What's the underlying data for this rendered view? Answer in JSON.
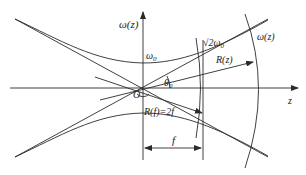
{
  "diagram": {
    "axes": {
      "vertical_label": "ω(z)",
      "horizontal_label": "z"
    },
    "labels": {
      "waist": "ω",
      "waist_sub": "0",
      "origin": "O",
      "angle": "θ",
      "angle_sub": "0",
      "sqrt2_waist": "√2ω",
      "sqrt2_waist_sub": "0",
      "radius": "R(z)",
      "beam_width": "ω(z)",
      "radius_at_f": "R(f)=2f",
      "focal_distance": "f"
    },
    "colors": {
      "stroke": "#2a2a2a",
      "background": "#ffffff"
    }
  }
}
